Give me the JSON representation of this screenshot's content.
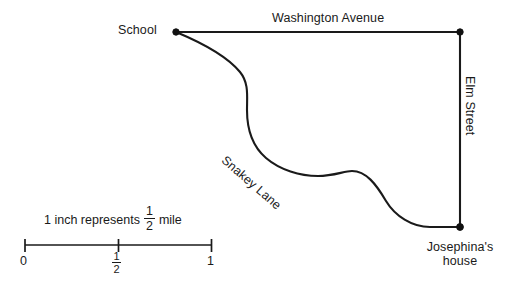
{
  "figure": {
    "type": "map-diagram",
    "background_color": "#ffffff",
    "ink_color": "#1a1a1a"
  },
  "map": {
    "places": [
      {
        "id": "school",
        "label": "School"
      },
      {
        "id": "josephinas-house",
        "label_line1": "Josephina's",
        "label_line2": "house"
      }
    ],
    "roads": [
      {
        "id": "washington-avenue",
        "label": "Washington Avenue",
        "shape": "straight-horizontal"
      },
      {
        "id": "elm-street",
        "label": "Elm Street",
        "shape": "straight-vertical"
      },
      {
        "id": "snakey-lane",
        "label": "Snakey Lane",
        "shape": "curved"
      }
    ]
  },
  "scale": {
    "caption_before": "1 inch represents",
    "caption_fraction_numerator": "1",
    "caption_fraction_denominator": "2",
    "caption_after": "mile",
    "ticks": [
      {
        "value": "0"
      },
      {
        "numerator": "1",
        "denominator": "2"
      },
      {
        "value": "1"
      }
    ]
  }
}
